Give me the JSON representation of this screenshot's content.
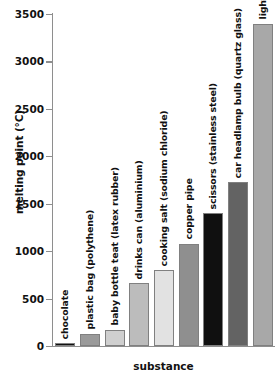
{
  "chart_data": {
    "type": "bar",
    "title": "",
    "xlabel": "substance",
    "ylabel": "melting point (°C)",
    "ylim": [
      0,
      3500
    ],
    "yticks": [
      0,
      500,
      1000,
      1500,
      2000,
      2500,
      3000,
      3500
    ],
    "ytick_labels": [
      "0",
      "500",
      "1000",
      "1500",
      "2000",
      "2500",
      "3000",
      "3500"
    ],
    "grid": false,
    "legend": false,
    "categories": [
      "chocolate",
      "plastic bag (polythene)",
      "baby bottle teat (latex rubber)",
      "drinks can (aluminium)",
      "cooking salt (sodium chloride)",
      "copper pipe",
      "scissors (stainless steel)",
      "car headlamp bulb (quartz glass)",
      "light bulb filament (tungsten)"
    ],
    "values": [
      30,
      130,
      170,
      660,
      800,
      1080,
      1400,
      1730,
      3400
    ],
    "bar_colors": [
      "#111111",
      "#9a9a9a",
      "#cfcfcf",
      "#bcbcbc",
      "#e2e2e2",
      "#8f8f8f",
      "#101010",
      "#636363",
      "#a8a8a8"
    ],
    "bar_edge_color": "#808080",
    "axis_color": "#8e8e8e",
    "text_color": "#111111",
    "background": "#ffffff"
  }
}
